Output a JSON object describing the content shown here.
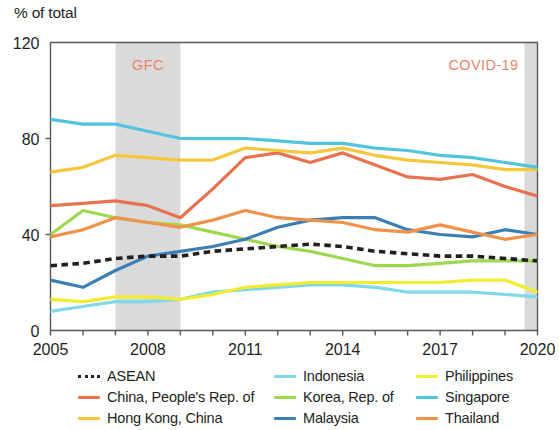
{
  "axis_unit_label": "% of total",
  "bands": [
    {
      "name": "GFC",
      "label": "GFC",
      "start": 2007,
      "end": 2009,
      "color": "#d4d4d4"
    },
    {
      "name": "COVID-19",
      "label": "COVID-19",
      "start": 2019.6,
      "end": 2020.25,
      "color": "#d4d4d4"
    }
  ],
  "legend": {
    "items": [
      {
        "label": "ASEAN",
        "color": "#231f20",
        "style": "dotted",
        "key": "asean"
      },
      {
        "label": "Indonesia",
        "color": "#7fd9e8",
        "style": "solid",
        "key": "indonesia"
      },
      {
        "label": "Philippines",
        "color": "#f4ec2e",
        "style": "solid",
        "key": "philippines"
      },
      {
        "label": "China, People's Rep. of",
        "color": "#e8724f",
        "style": "solid",
        "key": "china"
      },
      {
        "label": "Korea, Rep. of",
        "color": "#9ed84f",
        "style": "solid",
        "key": "korea"
      },
      {
        "label": "Singapore",
        "color": "#52c4e0",
        "style": "solid",
        "key": "singapore"
      },
      {
        "label": "Hong Kong, China",
        "color": "#f6c63c",
        "style": "solid",
        "key": "hongkong"
      },
      {
        "label": "Malaysia",
        "color": "#3b7fb5",
        "style": "solid",
        "key": "malaysia"
      },
      {
        "label": "Thailand",
        "color": "#f0924a",
        "style": "solid",
        "key": "thailand"
      }
    ]
  },
  "chart_data": {
    "type": "line",
    "title": "",
    "subtitle": "",
    "xlabel": "",
    "ylabel": "% of total",
    "xlim": [
      2005,
      2020
    ],
    "ylim": [
      0,
      120
    ],
    "yticks": [
      0,
      40,
      80,
      120
    ],
    "ytick_labels": [
      "0",
      "40",
      "80",
      "120"
    ],
    "xticks": [
      2005,
      2006,
      2007,
      2008,
      2009,
      2010,
      2011,
      2012,
      2013,
      2014,
      2015,
      2016,
      2017,
      2018,
      2019,
      2020
    ],
    "xtick_labels_shown": [
      "2005",
      "2008",
      "2011",
      "2014",
      "2017",
      "2020"
    ],
    "xtick_labels_shown_at": [
      2005,
      2008,
      2011,
      2014,
      2017,
      2020
    ],
    "grid": false,
    "legend_position": "below",
    "x": [
      2005,
      2006,
      2007,
      2008,
      2009,
      2010,
      2011,
      2012,
      2013,
      2014,
      2015,
      2016,
      2017,
      2018,
      2019,
      2020
    ],
    "series": [
      {
        "name": "ASEAN",
        "color": "#231f20",
        "style": "dotted",
        "values": [
          27,
          28,
          30,
          31,
          31,
          33,
          34,
          35,
          36,
          35,
          33,
          32,
          31,
          31,
          30,
          29
        ]
      },
      {
        "name": "China, People's Rep. of",
        "color": "#e8724f",
        "style": "solid",
        "values": [
          52,
          53,
          54,
          52,
          47,
          59,
          72,
          74,
          70,
          74,
          69,
          64,
          63,
          65,
          60,
          56
        ]
      },
      {
        "name": "Hong Kong, China",
        "color": "#f6c63c",
        "style": "solid",
        "values": [
          66,
          68,
          73,
          72,
          71,
          71,
          76,
          75,
          74,
          76,
          73,
          71,
          70,
          69,
          67,
          67
        ]
      },
      {
        "name": "Indonesia",
        "color": "#7fd9e8",
        "style": "solid",
        "values": [
          8,
          10,
          12,
          12,
          13,
          16,
          17,
          18,
          19,
          19,
          18,
          16,
          16,
          16,
          15,
          14
        ]
      },
      {
        "name": "Korea, Rep. of",
        "color": "#9ed84f",
        "style": "solid",
        "values": [
          40,
          50,
          47,
          45,
          44,
          41,
          38,
          35,
          33,
          30,
          27,
          27,
          28,
          29,
          29,
          29
        ]
      },
      {
        "name": "Malaysia",
        "color": "#3b7fb5",
        "style": "solid",
        "values": [
          21,
          18,
          25,
          31,
          33,
          35,
          38,
          43,
          46,
          47,
          47,
          42,
          40,
          39,
          42,
          40
        ]
      },
      {
        "name": "Philippines",
        "color": "#f4ec2e",
        "style": "solid",
        "values": [
          13,
          12,
          14,
          14,
          13,
          15,
          18,
          19,
          20,
          20,
          20,
          20,
          20,
          21,
          21,
          16
        ]
      },
      {
        "name": "Singapore",
        "color": "#52c4e0",
        "style": "solid",
        "values": [
          88,
          86,
          86,
          83,
          80,
          80,
          80,
          79,
          78,
          78,
          76,
          75,
          73,
          72,
          70,
          68
        ]
      },
      {
        "name": "Thailand",
        "color": "#f0924a",
        "style": "solid",
        "values": [
          39,
          42,
          47,
          45,
          43,
          46,
          50,
          47,
          46,
          45,
          42,
          41,
          44,
          41,
          38,
          40
        ]
      }
    ]
  }
}
